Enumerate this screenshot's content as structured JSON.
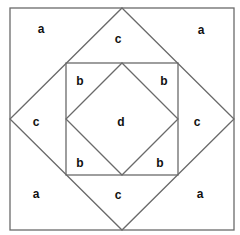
{
  "diagram": {
    "colors": {
      "line": "#6a6a6a",
      "label": "#111111",
      "background": "#ffffff"
    },
    "shapes": {
      "outer_square": {
        "x1": 10,
        "y1": 8,
        "x2": 234,
        "y2": 230
      },
      "outer_diamond": {
        "top": [
          122,
          8
        ],
        "right": [
          234,
          119
        ],
        "bottom": [
          122,
          230
        ],
        "left": [
          10,
          119
        ]
      },
      "inner_square": {
        "x1": 66,
        "y1": 63,
        "x2": 178,
        "y2": 175
      },
      "inner_diamond": {
        "top": [
          122,
          63
        ],
        "right": [
          178,
          119
        ],
        "bottom": [
          122,
          175
        ],
        "left": [
          66,
          119
        ]
      }
    },
    "labels": {
      "a_top_left": "a",
      "a_top_right": "a",
      "a_bottom_left": "a",
      "a_bottom_right": "a",
      "c_top": "c",
      "c_left": "c",
      "c_right": "c",
      "c_bottom": "c",
      "b_top_left": "b",
      "b_top_right": "b",
      "b_bottom_left": "b",
      "b_bottom_right": "b",
      "d_center": "d"
    }
  }
}
